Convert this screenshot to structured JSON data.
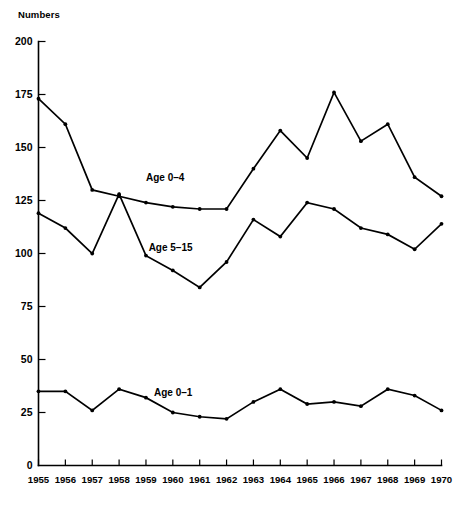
{
  "chart_data": {
    "type": "line",
    "title": "",
    "ylabel": "Numbers",
    "xlabel": "",
    "ylim": [
      0,
      200
    ],
    "ytick_values": [
      0,
      25,
      50,
      75,
      100,
      125,
      150,
      175,
      200
    ],
    "ytick_labels": [
      "0",
      "25",
      "50",
      "75",
      "100",
      "125",
      "150",
      "175",
      "200"
    ],
    "grid": false,
    "legend_position": "inline-annotations",
    "x": [
      1955,
      1956,
      1957,
      1958,
      1959,
      1960,
      1961,
      1962,
      1963,
      1964,
      1965,
      1966,
      1967,
      1968,
      1969,
      1970
    ],
    "xtick_labels": [
      "1955",
      "1956",
      "1957",
      "1958",
      "1959",
      "1960",
      "1961",
      "1962",
      "1963",
      "1964",
      "1965",
      "1966",
      "1967",
      "1968",
      "1969",
      "1970"
    ],
    "series": [
      {
        "name": "Age 0–4",
        "label": "Age 0–4",
        "label_x": 1959.0,
        "label_y": 134,
        "values": [
          173,
          161,
          130,
          127,
          124,
          122,
          121,
          121,
          140,
          158,
          145,
          176,
          153,
          161,
          136,
          127
        ]
      },
      {
        "name": "Age 5–15",
        "label": "Age 5–15",
        "label_x": 1959.1,
        "label_y": 101,
        "values": [
          119,
          112,
          100,
          128,
          99,
          92,
          84,
          96,
          116,
          108,
          124,
          121,
          112,
          109,
          102,
          114
        ]
      },
      {
        "name": "Age 0–1",
        "label": "Age 0–1",
        "label_x": 1959.3,
        "label_y": 33,
        "values": [
          35,
          35,
          26,
          36,
          32,
          25,
          23,
          22,
          30,
          36,
          29,
          30,
          28,
          36,
          33,
          26
        ]
      }
    ]
  },
  "axis": {
    "y_title": "Numbers"
  }
}
